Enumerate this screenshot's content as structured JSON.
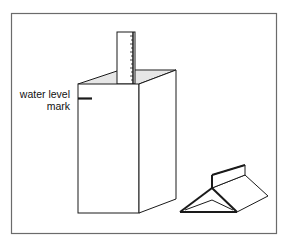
{
  "diagram": {
    "labels": {
      "water_level_line1": "water level",
      "water_level_line2": "mark"
    },
    "elements": [
      "frame",
      "tall-box",
      "ruler",
      "water-level-mark",
      "folded-tent"
    ],
    "colors": {
      "stroke": "#1a1a1a",
      "frame": "#6b6b6b",
      "top_shading": "#e4e4e4"
    }
  }
}
